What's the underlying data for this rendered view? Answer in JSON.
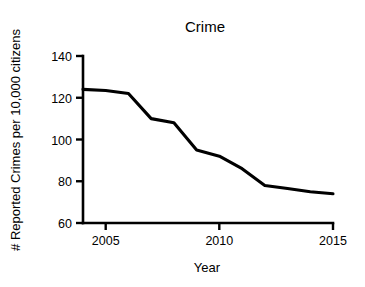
{
  "chart_data": {
    "type": "line",
    "title": "Crime",
    "xlabel": "Year",
    "ylabel": "# Reported Crimes per 10,000 citizens",
    "xlim": [
      2004,
      2015
    ],
    "ylim": [
      60,
      140
    ],
    "xticks": [
      2005,
      2010,
      2015
    ],
    "xtick_labels": [
      "2005",
      "2010",
      "2015"
    ],
    "yticks": [
      60,
      80,
      100,
      120,
      140
    ],
    "ytick_labels": [
      "60",
      "80",
      "100",
      "120",
      "140"
    ],
    "grid": false,
    "legend": false,
    "line_color": "#000000",
    "background_color": "#ffffff",
    "x": [
      2004,
      2005,
      2006,
      2007,
      2008,
      2009,
      2010,
      2011,
      2012,
      2013,
      2014,
      2015
    ],
    "values": [
      124,
      123.5,
      122,
      110,
      108,
      95,
      92,
      86,
      78,
      76.5,
      75,
      74
    ],
    "series": [
      {
        "name": "Reported Crimes per 10,000 citizens",
        "values": [
          124,
          123.5,
          122,
          110,
          108,
          95,
          92,
          86,
          78,
          76.5,
          75,
          74
        ]
      }
    ]
  },
  "chart": {
    "title": "Crime",
    "x_axis_title": "Year",
    "y_axis_title": "# Reported Crimes per 10,000 citizens",
    "x_tick_labels": [
      "2005",
      "2010",
      "2015"
    ],
    "y_tick_labels": [
      "60",
      "80",
      "100",
      "120",
      "140"
    ]
  }
}
